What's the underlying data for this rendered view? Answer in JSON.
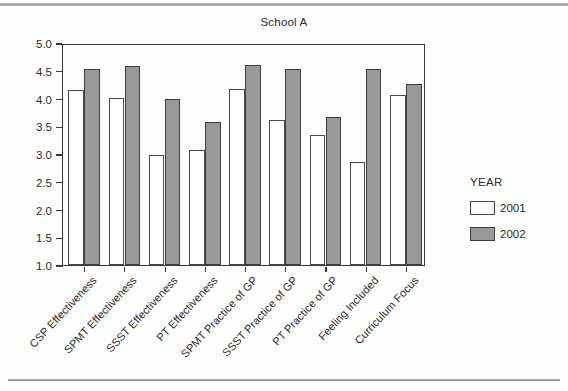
{
  "chart_data": {
    "type": "bar",
    "title": "School A",
    "xlabel": "",
    "ylabel": "",
    "ylim": [
      1.0,
      5.0
    ],
    "ytick_labels": [
      "5.0",
      "4.5",
      "4.0",
      "3.5",
      "3.0",
      "2.5",
      "2.0",
      "1.5",
      "1.0"
    ],
    "ytick_values": [
      5.0,
      4.5,
      4.0,
      3.5,
      3.0,
      2.5,
      2.0,
      1.5,
      1.0
    ],
    "grid": false,
    "legend_position": "right",
    "legend_title": "YEAR",
    "categories": [
      "CSP Effectiveness",
      "SPMT Effectiveness",
      "SSST Effectiveness",
      "PT Effectiveness",
      "SPMT Practice of GP",
      "SSST Practice of GP",
      "PT Practice of GP",
      "Feeling Included",
      "Curriculum Focus"
    ],
    "series": [
      {
        "name": "2001",
        "color": "#ffffff",
        "values": [
          4.15,
          4.01,
          2.99,
          3.07,
          4.18,
          3.61,
          3.34,
          2.86,
          4.07
        ]
      },
      {
        "name": "2002",
        "color": "#999999",
        "values": [
          4.53,
          4.58,
          4.0,
          3.57,
          4.6,
          4.53,
          3.66,
          4.53,
          4.26
        ]
      }
    ]
  }
}
